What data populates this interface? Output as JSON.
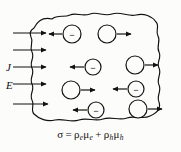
{
  "figure": {
    "type": "physics-diagram",
    "background_color": "#fcfcfa",
    "ink_color": "#111111"
  },
  "field_labels": [
    {
      "symbol": "J",
      "meaning": "current density",
      "x": 8,
      "y": 67
    },
    {
      "symbol": "E",
      "meaning": "electric field",
      "x": 8,
      "y": 85
    }
  ],
  "field_arrows": {
    "count": 5,
    "direction": "right",
    "label": "field-arrow",
    "rows_y": [
      33,
      50,
      67,
      84,
      104
    ],
    "x_start": 13,
    "x_end": 48
  },
  "carriers": [
    {
      "id": "electron-1",
      "kind": "electron",
      "sign": "−",
      "cx": 72,
      "cy": 34,
      "r": 9,
      "arrow_direction": "left"
    },
    {
      "id": "hole-1",
      "kind": "hole",
      "sign": "",
      "cx": 107,
      "cy": 34,
      "r": 9,
      "arrow_direction": "right"
    },
    {
      "id": "electron-2",
      "kind": "electron",
      "sign": "−",
      "cx": 93,
      "cy": 67,
      "r": 8,
      "arrow_direction": "left"
    },
    {
      "id": "hole-2",
      "kind": "hole",
      "sign": "",
      "cx": 135,
      "cy": 65,
      "r": 9,
      "arrow_direction": "right"
    },
    {
      "id": "hole-3",
      "kind": "hole",
      "sign": "",
      "cx": 71,
      "cy": 90,
      "r": 9,
      "arrow_direction": "right"
    },
    {
      "id": "electron-3",
      "kind": "electron",
      "sign": "−",
      "cx": 136,
      "cy": 89,
      "r": 8,
      "arrow_direction": "left"
    },
    {
      "id": "electron-4",
      "kind": "electron",
      "sign": "−",
      "cx": 96,
      "cy": 110,
      "r": 8,
      "arrow_direction": "left"
    },
    {
      "id": "hole-4",
      "kind": "hole",
      "sign": "",
      "cx": 138,
      "cy": 109,
      "r": 9,
      "arrow_direction": "right"
    }
  ],
  "equation": {
    "sigma": "σ",
    "equals": "=",
    "term1_rho": "ρ",
    "term1_rho_sub": "e",
    "term1_mu": "μ",
    "term1_mu_sub": "e",
    "plus": "+",
    "term2_rho": "ρ",
    "term2_rho_sub": "h",
    "term2_mu": "μ",
    "term2_mu_sub": "h",
    "plain_text": "σ = ρeμe + ρhμh"
  }
}
